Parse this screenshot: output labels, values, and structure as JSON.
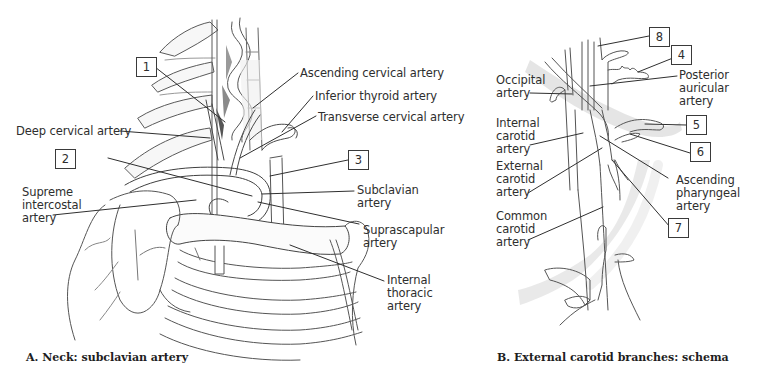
{
  "figure": {
    "panel_a": {
      "caption": "A. Neck: subclavian artery",
      "labels": {
        "ascending_cervical": "Ascending cervical artery",
        "inferior_thyroid": "Inferior thyroid artery",
        "transverse_cervical": "Transverse cervical artery",
        "deep_cervical": "Deep cervical artery",
        "supreme_intercostal": "Supreme\nintercostal\nartery",
        "subclavian": "Subclavian\nartery",
        "suprascapular": "Suprascapular\nartery",
        "internal_thoracic": "Internal\nthoracic\nartery"
      },
      "numbers": [
        "1",
        "2",
        "3"
      ]
    },
    "panel_b": {
      "caption": "B. External carotid branches: schema",
      "labels": {
        "occipital": "Occipital\nartery",
        "posterior_auricular": "Posterior\nauricular\nartery",
        "internal_carotid": "Internal\ncarotid\nartery",
        "external_carotid": "External\ncarotid\nartery",
        "ascending_pharyngeal": "Ascending\npharyngeal\nartery",
        "common_carotid": "Common\ncarotid\nartery"
      },
      "numbers": [
        "8",
        "4",
        "5",
        "6",
        "7"
      ]
    },
    "colors": {
      "line": "#3a3a3a",
      "text": "#2e2e2e",
      "shade": "#d9d9d9",
      "background": "#ffffff"
    }
  }
}
